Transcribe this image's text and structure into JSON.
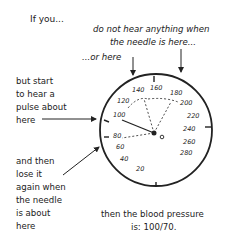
{
  "labels": {
    "if_you": "If you...",
    "no_hear_1": "do not hear anything when",
    "no_hear_2": "the needle is here...",
    "or_here": "...or here",
    "start_hear": "but start\nto hear a\npulse about\nhere",
    "lose_it": "and then\nlose it\nagain when\nthe needle\nis about\nhere",
    "result_1": "then the blood pressure",
    "result_2": "is: 100/70."
  },
  "gauge": {
    "ticks": [
      {
        "label": "160"
      },
      {
        "label": "180"
      },
      {
        "label": "200"
      },
      {
        "label": "220"
      },
      {
        "label": "240"
      },
      {
        "label": "260"
      },
      {
        "label": "280"
      },
      {
        "label": "0"
      },
      {
        "label": "20"
      },
      {
        "label": "40"
      },
      {
        "label": "60"
      },
      {
        "label": "80"
      },
      {
        "label": "100"
      },
      {
        "label": "120"
      },
      {
        "label": "140"
      }
    ],
    "reading": {
      "systolic": 100,
      "diastolic": 70
    },
    "colors": {
      "ink": "#222222",
      "background": "#ffffff"
    }
  }
}
